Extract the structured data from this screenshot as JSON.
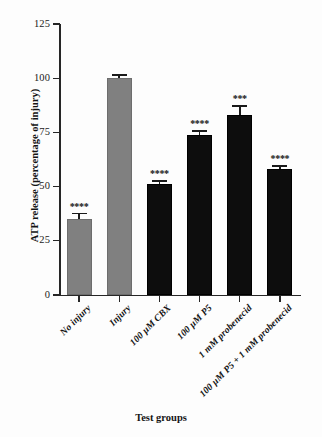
{
  "figure": {
    "background_color": "#fdfdfd",
    "axis_color": "#262626",
    "bar_colors": {
      "control_gray": "#808080",
      "treatment_black": "#0d0d0d"
    }
  },
  "chart_data": {
    "type": "bar",
    "title": "",
    "xlabel": "Test groups",
    "ylabel": "ATP release (percentage of injury)",
    "ylim": [
      0,
      125
    ],
    "yticks": [
      0,
      25,
      50,
      75,
      100,
      125
    ],
    "ytick_labels": [
      "0",
      "25",
      "50",
      "75",
      "100",
      "125"
    ],
    "grid": false,
    "legend": "none",
    "categories": [
      "No injury",
      "Injury",
      "100 µM CBX",
      "100 µM P5",
      "1 mM probenecid",
      "100 µM P5 + 1 mM probenecid"
    ],
    "values": [
      35,
      100,
      51,
      74,
      83,
      58
    ],
    "errors": [
      3.0,
      1.8,
      2.0,
      2.0,
      4.5,
      1.8
    ],
    "bar_fill": [
      "gray",
      "gray",
      "black",
      "black",
      "black",
      "black"
    ],
    "annotations": [
      "****",
      "",
      "****",
      "****",
      "***",
      "****"
    ]
  }
}
